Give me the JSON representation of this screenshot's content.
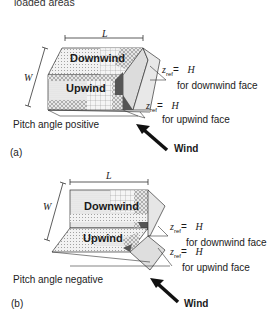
{
  "caption": {
    "line2": "loaded areas"
  },
  "panel_a": {
    "dim_length": "L",
    "dim_width": "W",
    "downwind_label": "Downwind",
    "upwind_label": "Upwind",
    "zref_downwind": {
      "z": "z",
      "sub": "ref",
      "eq": "=",
      "val": "H",
      "desc": "for downwind face"
    },
    "zref_upwind": {
      "z": "z",
      "sub": "ref",
      "eq": "=",
      "val": "H",
      "desc": "for upwind face"
    },
    "pitch_label": "Pitch angle positive",
    "panel_tag": "(a)",
    "wind_label": "Wind"
  },
  "panel_b": {
    "dim_length": "L",
    "dim_width": "W",
    "downwind_label": "Downwind",
    "upwind_label": "Upwind",
    "zref_downwind": {
      "z": "z",
      "sub": "ref",
      "eq": "=",
      "val": "H",
      "desc": "for downwind face"
    },
    "zref_upwind": {
      "z": "z",
      "sub": "ref",
      "eq": "=",
      "val": "H",
      "desc": "for upwind face"
    },
    "pitch_label": "Pitch angle negative",
    "panel_tag": "(b)",
    "wind_label": "Wind"
  }
}
